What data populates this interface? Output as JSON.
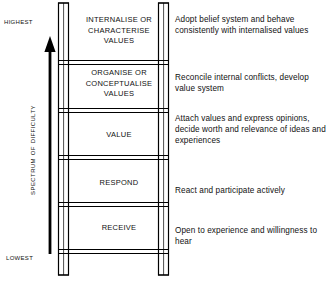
{
  "diagram": {
    "axis": {
      "top_label": "Highest",
      "bottom_label": "Lowest",
      "vertical_label": "Spectrum of difficulty",
      "arrow_direction": "up",
      "arrow_icon": "arrow-up-icon"
    },
    "colors": {
      "rail": "#000000",
      "rung": "#000000",
      "text": "#111111",
      "background": "#ffffff"
    },
    "steps": [
      {
        "level": 5,
        "label": "INTERNALISE OR\nCHARACTERISE\nVALUES",
        "description": "Adopt belief system and behave consistently with internalised values"
      },
      {
        "level": 4,
        "label": "ORGANISE OR\nCONCEPTUALISE\nVALUES",
        "description": "Reconcile internal conflicts, develop value system"
      },
      {
        "level": 3,
        "label": "VALUE",
        "description": "Attach values and express opinions, decide worth and relevance of ideas and experiences"
      },
      {
        "level": 2,
        "label": "RESPOND",
        "description": "React and participate actively"
      },
      {
        "level": 1,
        "label": "RECEIVE",
        "description": "Open to experience and willingness to hear"
      }
    ]
  }
}
